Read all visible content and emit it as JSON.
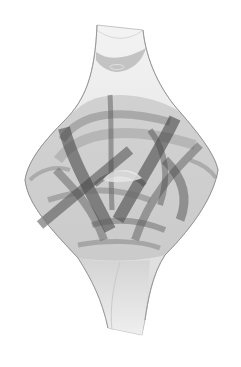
{
  "image": {
    "kind": "abstract generative attractor artwork",
    "palette": {
      "background": "#ffffff",
      "light": "#e6e6e6",
      "mid": "#a8a8a8",
      "dark": "#4a4a4a",
      "darkest": "#2a2a2a"
    },
    "shape": "vertical vase/diamond silhouette with overlapping translucent ribbons"
  }
}
